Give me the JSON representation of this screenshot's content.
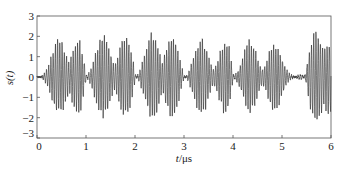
{
  "chart_data": {
    "type": "line",
    "title": "",
    "xlabel": "t/μs",
    "xlabel_var": "t",
    "xlabel_unit": "/μs",
    "ylabel": "s(t)",
    "xlim": [
      0,
      6
    ],
    "ylim": [
      -3,
      3
    ],
    "xticks": [
      0,
      1,
      2,
      3,
      4,
      5,
      6
    ],
    "yticks": [
      -3,
      -2,
      -1,
      0,
      1,
      2,
      3
    ],
    "xtick_labels": [
      "0",
      "1",
      "2",
      "3",
      "4",
      "5",
      "6"
    ],
    "ytick_labels": [
      "−3",
      "−2",
      "−1",
      "0",
      "1",
      "2",
      "3"
    ],
    "grid": false,
    "legend": null,
    "line_color": "#222222",
    "envelope_peaks": [
      {
        "t": 0.45,
        "amp": 2.0
      },
      {
        "t": 0.85,
        "amp": 1.9
      },
      {
        "t": 1.35,
        "amp": 2.2
      },
      {
        "t": 1.8,
        "amp": 2.1
      },
      {
        "t": 2.35,
        "amp": 2.3
      },
      {
        "t": 2.75,
        "amp": 2.1
      },
      {
        "t": 3.35,
        "amp": 2.0
      },
      {
        "t": 3.85,
        "amp": 1.9
      },
      {
        "t": 4.35,
        "amp": 1.9
      },
      {
        "t": 4.85,
        "amp": 1.8
      },
      {
        "t": 5.7,
        "amp": 2.4
      },
      {
        "t": 5.95,
        "amp": 1.9
      }
    ],
    "envelope_nulls": [
      0.05,
      1.02,
      2.03,
      3.02,
      4.02,
      5.45
    ],
    "carrier_freq_mhz": 22,
    "max_amplitude": 2.4,
    "min_amplitude": -2.4
  }
}
